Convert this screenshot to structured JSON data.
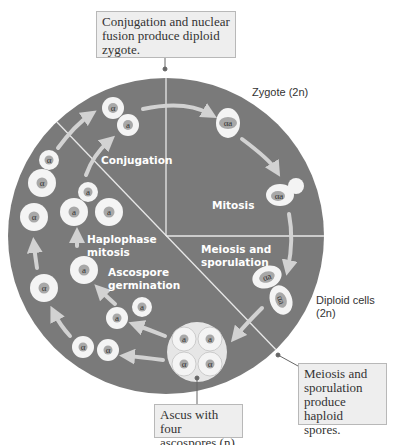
{
  "callouts": {
    "top": "Conjugation and nuclear fusion produce diploid zygote.",
    "right": "Meiosis and sporulation produce haploid spores.",
    "bottom": "Ascus with four ascospores (n)"
  },
  "outside_labels": {
    "zygote": "Zygote (2n)",
    "diploid": "Diploid cells (2n)"
  },
  "stages": {
    "conjugation": "Conjugation",
    "mitosis": "Mitosis",
    "meiosis": "Meiosis and sporulation",
    "haplophase": "Haplophase mitosis",
    "germination": "Ascospore germination"
  },
  "cells": {
    "alpha": "α",
    "a": "a",
    "zygote": "αa"
  },
  "colors": {
    "circle_bg": "#7a7a7a",
    "cell_white": "#f4f4f4",
    "nucleus": "#a8a8a8",
    "arrow": "#d2d2d2",
    "callout_bg": "#eeeeee"
  }
}
